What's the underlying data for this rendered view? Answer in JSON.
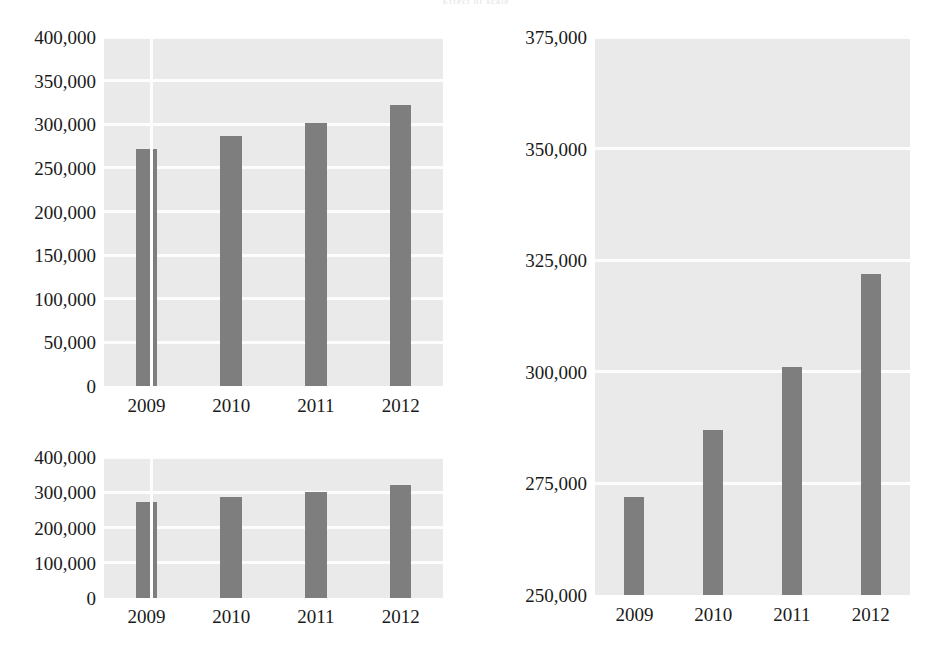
{
  "header": {
    "ghost_text": "Effect of scale"
  },
  "colors": {
    "bar": "#7e7e7e",
    "plot_background": "#eaeaea",
    "gridline": "#fdfdfd",
    "page_background": "#ffffff",
    "text": "#1a1a1a"
  },
  "charts": [
    {
      "id": "chart-topleft",
      "name": "full-scale-bar-chart",
      "yticks": [
        "0",
        "50,000",
        "100,000",
        "150,000",
        "200,000",
        "250,000",
        "300,000",
        "350,000",
        "400,000"
      ],
      "xticks": [
        "2009",
        "2010",
        "2011",
        "2012"
      ],
      "divider_after_category": 0
    },
    {
      "id": "chart-bottomleft",
      "name": "compressed-bar-chart",
      "yticks": [
        "0",
        "100,000",
        "200,000",
        "300,000",
        "400,000"
      ],
      "xticks": [
        "2009",
        "2010",
        "2011",
        "2012"
      ],
      "divider_after_category": 0
    },
    {
      "id": "chart-right",
      "name": "magnified-bar-chart",
      "yticks": [
        "250,000",
        "275,000",
        "300,000",
        "325,000",
        "350,000",
        "375,000"
      ],
      "xticks": [
        "2009",
        "2010",
        "2011",
        "2012"
      ],
      "divider_after_category": null
    }
  ],
  "chart_data": [
    {
      "type": "bar",
      "id": "chart-topleft",
      "title": "",
      "xlabel": "",
      "ylabel": "",
      "categories": [
        "2009",
        "2010",
        "2011",
        "2012"
      ],
      "values": [
        272000,
        287000,
        301000,
        322000
      ],
      "ylim": [
        0,
        400000
      ],
      "ytick_step": 50000,
      "ytick_labels": [
        "0",
        "50,000",
        "100,000",
        "150,000",
        "200,000",
        "250,000",
        "300,000",
        "350,000",
        "400,000"
      ],
      "grid": true,
      "legend": false,
      "bar_color": "#7e7e7e",
      "note": "Baseline begins at zero; differences between years look small."
    },
    {
      "type": "bar",
      "id": "chart-bottomleft",
      "title": "",
      "xlabel": "",
      "ylabel": "",
      "categories": [
        "2009",
        "2010",
        "2011",
        "2012"
      ],
      "values": [
        272000,
        287000,
        301000,
        322000
      ],
      "ylim": [
        0,
        400000
      ],
      "ytick_step": 100000,
      "ytick_labels": [
        "0",
        "100,000",
        "200,000",
        "300,000",
        "400,000"
      ],
      "grid": true,
      "legend": false,
      "bar_color": "#7e7e7e",
      "note": "Same data, vertically compressed; differences look even smaller."
    },
    {
      "type": "bar",
      "id": "chart-right",
      "title": "",
      "xlabel": "",
      "ylabel": "",
      "categories": [
        "2009",
        "2010",
        "2011",
        "2012"
      ],
      "values": [
        272000,
        287000,
        301000,
        322000
      ],
      "ylim": [
        250000,
        375000
      ],
      "ytick_step": 25000,
      "ytick_labels": [
        "250,000",
        "275,000",
        "300,000",
        "325,000",
        "350,000",
        "375,000"
      ],
      "grid": true,
      "legend": false,
      "bar_color": "#7e7e7e",
      "note": "Truncated baseline at 250,000 exaggerates the year-over-year growth."
    }
  ]
}
